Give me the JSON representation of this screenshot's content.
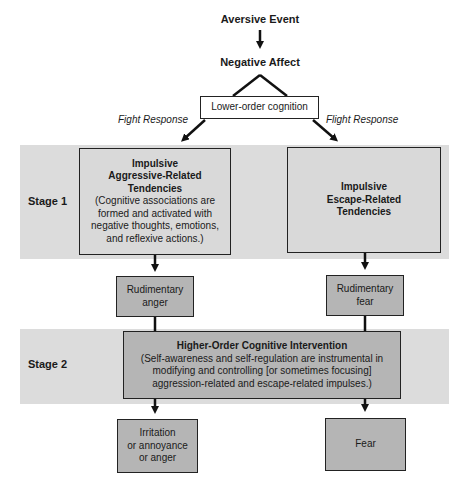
{
  "top": {
    "event": "Aversive Event",
    "affect": "Negative Affect",
    "lower_order": "Lower-order cognition",
    "fight_label": "Fight Response",
    "flight_label": "Flight Response"
  },
  "stage1": {
    "label": "Stage 1",
    "left_box": {
      "title_l1": "Impulsive",
      "title_l2": "Aggressive-Related",
      "title_l3": "Tendencies",
      "desc_l1": "(Cognitive associations are",
      "desc_l2": "formed and activated with",
      "desc_l3": "negative thoughts, emotions,",
      "desc_l4": "and reflexive actions.)"
    },
    "right_box": {
      "title_l1": "Impulsive",
      "title_l2": "Escape-Related",
      "title_l3": "Tendencies"
    }
  },
  "rudimentary": {
    "anger_l1": "Rudimentary",
    "anger_l2": "anger",
    "fear_l1": "Rudimentary",
    "fear_l2": "fear"
  },
  "stage2": {
    "label": "Stage 2",
    "box": {
      "title": "Higher-Order Cognitive Intervention",
      "desc_l1": "(Self-awareness and self-regulation are instrumental in",
      "desc_l2": "modifying and controlling [or sometimes focusing]",
      "desc_l3": "aggression-related and escape-related impulses.)"
    }
  },
  "outcomes": {
    "left_l1": "Irritation",
    "left_l2": "or annoyance",
    "left_l3": "or anger",
    "right": "Fear"
  },
  "colors": {
    "band": "#dcdcdc",
    "box_light": "#d9d9d9",
    "box_mid": "#b5b5b5",
    "line": "#111111"
  }
}
